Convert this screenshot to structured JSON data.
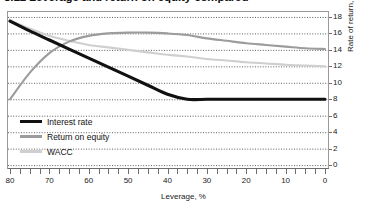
{
  "title": "8.12  Leverage and return on equity compared",
  "colors": {
    "interest_rate": "#111111",
    "return_on_equity": "#9c9c9c",
    "wacc": "#cfcfcf",
    "grid": "#4d4d4d",
    "frame": "#9a9a9a",
    "axis": "#6e6e6e",
    "text": "#1a1a1a"
  },
  "axes": {
    "x_title": "Leverage, %",
    "y_title": "Rate of return, %",
    "x_tick_labels": [
      "80",
      "70",
      "60",
      "50",
      "40",
      "30",
      "20",
      "10",
      "0"
    ],
    "y_tick_labels": [
      "18",
      "16",
      "14",
      "12",
      "10",
      "8",
      "6",
      "4",
      "2",
      "0"
    ]
  },
  "legend": {
    "items": [
      {
        "label": "Interest rate",
        "color": "#111111",
        "thickness": 3.2
      },
      {
        "label": "Return on equity",
        "color": "#9c9c9c",
        "thickness": 2.2
      },
      {
        "label": "WACC",
        "color": "#cfcfcf",
        "thickness": 2.2
      }
    ]
  },
  "chart_data": {
    "type": "line",
    "title": "8.12  Leverage and return on equity compared",
    "xlabel": "Leverage, %",
    "ylabel": "Rate of return, %",
    "xlim": [
      80,
      0
    ],
    "ylim": [
      0,
      18
    ],
    "x_reversed": true,
    "grid": true,
    "legend_position": "inside-lower-left",
    "x": [
      80,
      75,
      70,
      65,
      60,
      55,
      50,
      45,
      40,
      35,
      30,
      25,
      20,
      15,
      10,
      5,
      0
    ],
    "series": [
      {
        "name": "Interest rate",
        "color": "#111111",
        "values": [
          17.5,
          16.3,
          15.2,
          14.1,
          13.0,
          11.9,
          10.8,
          9.7,
          8.6,
          8.0,
          8.0,
          8.0,
          8.0,
          8.0,
          8.0,
          8.0,
          8.0
        ]
      },
      {
        "name": "Return on equity",
        "color": "#9c9c9c",
        "values": [
          8.0,
          11.2,
          13.6,
          15.0,
          15.7,
          16.0,
          16.1,
          16.1,
          16.0,
          15.8,
          15.4,
          15.1,
          14.8,
          14.6,
          14.4,
          14.2,
          14.1
        ]
      },
      {
        "name": "WACC",
        "color": "#cfcfcf",
        "values": [
          17.6,
          16.6,
          15.7,
          15.1,
          14.6,
          14.3,
          14.0,
          13.7,
          13.4,
          13.2,
          12.9,
          12.7,
          12.5,
          12.35,
          12.2,
          12.1,
          12.0
        ]
      }
    ]
  }
}
